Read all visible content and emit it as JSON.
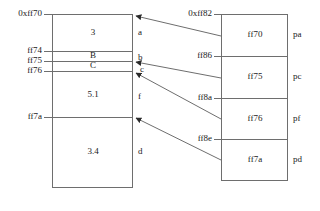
{
  "diagram": {
    "stroke_color": "#6e6e6e",
    "text_color": "#1a1a1a",
    "background": "#ffffff"
  },
  "left_box": {
    "name": "left-memory-block",
    "addresses": [
      {
        "label": "0xff70",
        "y": 14
      },
      {
        "label": "ff74",
        "y": 51
      },
      {
        "label": "ff75",
        "y": 61
      },
      {
        "label": "ff76",
        "y": 71
      },
      {
        "label": "ff7a",
        "y": 117
      }
    ],
    "cells": [
      {
        "value": "3",
        "y": 32
      },
      {
        "value": "B",
        "y": 56
      },
      {
        "value": "C",
        "y": 66
      },
      {
        "value": "5.1",
        "y": 95
      },
      {
        "value": "3.4",
        "y": 152
      }
    ],
    "side_tags": [
      {
        "label": "a",
        "y": 32
      },
      {
        "label": "b",
        "y": 58
      },
      {
        "label": "c",
        "y": 70
      },
      {
        "label": "f",
        "y": 97
      },
      {
        "label": "d",
        "y": 152
      }
    ]
  },
  "right_box": {
    "name": "right-pointer-block",
    "addresses": [
      {
        "label": "0xff82",
        "y": 14
      },
      {
        "label": "ff86",
        "y": 56
      },
      {
        "label": "ff8a",
        "y": 98
      },
      {
        "label": "ff8e",
        "y": 139
      }
    ],
    "cells": [
      {
        "value": "ff70",
        "y": 35
      },
      {
        "value": "ff75",
        "y": 77
      },
      {
        "value": "ff76",
        "y": 119
      },
      {
        "value": "ff7a",
        "y": 160
      }
    ],
    "side_tags": [
      {
        "label": "pa",
        "y": 35
      },
      {
        "label": "pc",
        "y": 77
      },
      {
        "label": "pf",
        "y": 119
      },
      {
        "label": "pd",
        "y": 160
      }
    ]
  },
  "arrows": [
    {
      "name": "arrow-pa-to-ff70",
      "from_value": "ff70",
      "to_address": "0xff70"
    },
    {
      "name": "arrow-pc-to-ff75",
      "from_value": "ff75",
      "to_address": "ff75"
    },
    {
      "name": "arrow-pf-to-ff76",
      "from_value": "ff76",
      "to_address": "ff76"
    },
    {
      "name": "arrow-pd-to-ff7a",
      "from_value": "ff7a",
      "to_address": "ff7a"
    }
  ]
}
